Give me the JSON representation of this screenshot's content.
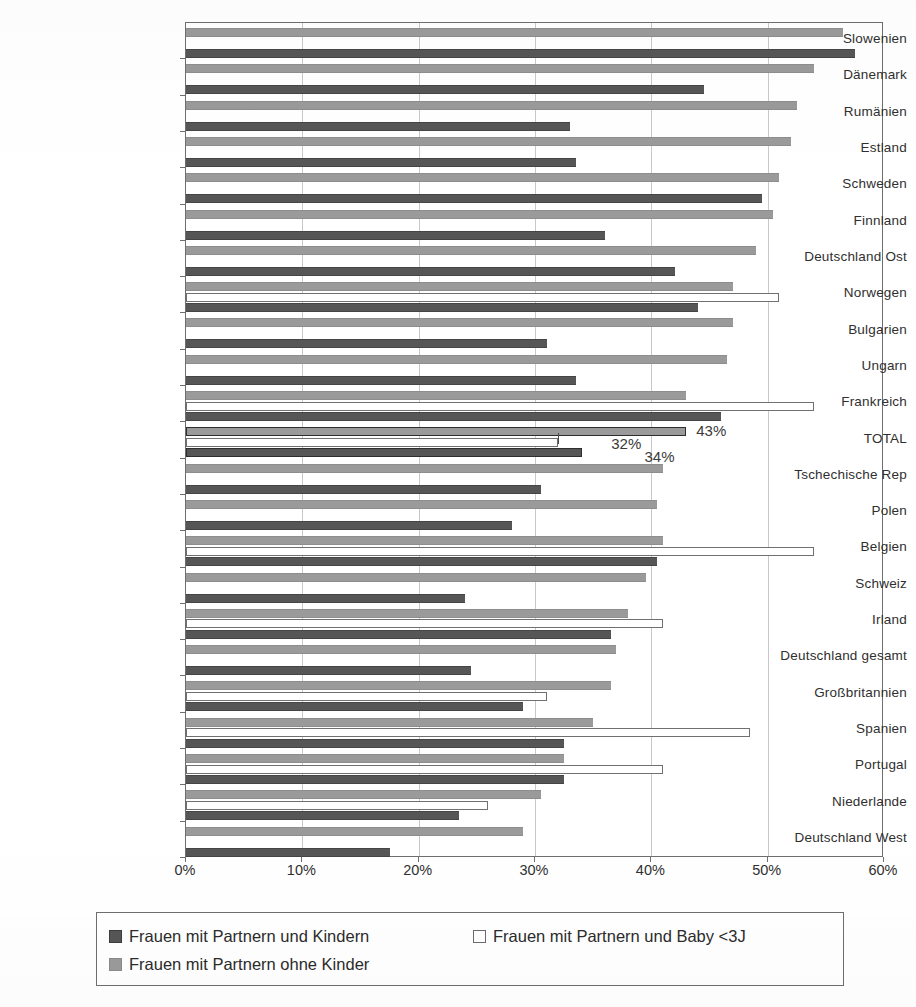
{
  "chart_data": {
    "type": "bar",
    "orientation": "horizontal",
    "title": "",
    "xlabel": "",
    "ylabel": "",
    "xlim": [
      0,
      60
    ],
    "xunit": "%",
    "grid": true,
    "legend_position": "bottom",
    "x_ticks": [
      "0%",
      "10%",
      "20%",
      "30%",
      "40%",
      "50%",
      "60%"
    ],
    "x_tick_values": [
      0,
      10,
      20,
      30,
      40,
      50,
      60
    ],
    "categories": [
      "Slowenien",
      "Dänemark",
      "Rumänien",
      "Estland",
      "Schweden",
      "Finnland",
      "Deutschland Ost",
      "Norwegen",
      "Bulgarien",
      "Ungarn",
      "Frankreich",
      "TOTAL",
      "Tschechische Rep",
      "Polen",
      "Belgien",
      "Schweiz",
      "Irland",
      "Deutschland gesamt",
      "Großbritannien",
      "Spanien",
      "Portugal",
      "Niederlande",
      "Deutschland West"
    ],
    "series": [
      {
        "name": "Frauen mit Partnern ohne Kinder",
        "key": "ohne_kinder",
        "color": "#9a9a9a",
        "values": [
          56.5,
          54.0,
          52.5,
          52.0,
          51.0,
          50.5,
          49.0,
          47.0,
          47.0,
          46.5,
          43.0,
          43.0,
          41.0,
          40.5,
          41.0,
          39.5,
          38.0,
          37.0,
          36.5,
          35.0,
          32.5,
          30.5,
          29.0
        ]
      },
      {
        "name": "Frauen mit Partnern und Baby <3J",
        "key": "baby_unter_3j",
        "color": "#ffffff",
        "values": [
          null,
          null,
          null,
          null,
          null,
          null,
          null,
          51.0,
          null,
          null,
          54.0,
          32.0,
          null,
          null,
          54.0,
          null,
          41.0,
          null,
          31.0,
          48.5,
          41.0,
          26.0,
          null
        ]
      },
      {
        "name": "Frauen mit Partnern und Kindern",
        "key": "mit_kindern",
        "color": "#565656",
        "values": [
          57.5,
          44.5,
          33.0,
          33.5,
          49.5,
          36.0,
          42.0,
          44.0,
          31.0,
          33.5,
          46.0,
          34.0,
          30.5,
          28.0,
          40.5,
          24.0,
          36.5,
          24.5,
          29.0,
          32.5,
          32.5,
          23.5,
          17.5
        ]
      }
    ],
    "annotations": [
      {
        "label": "43%",
        "category": "TOTAL",
        "series": "ohne_kinder",
        "value": 43
      },
      {
        "label": "32%",
        "category": "TOTAL",
        "series": "baby_unter_3j",
        "value": 32
      },
      {
        "label": "34%",
        "category": "TOTAL",
        "series": "mit_kindern",
        "value": 34
      }
    ]
  },
  "legend": {
    "items": [
      {
        "label": "Frauen mit Partnern und Kindern",
        "swatch": "s-dark"
      },
      {
        "label": "Frauen mit Partnern und Baby <3J",
        "swatch": "s-white"
      },
      {
        "label": "Frauen mit Partnern ohne Kinder",
        "swatch": "s-gray"
      }
    ]
  },
  "colors": {
    "series_dark": "#565656",
    "series_gray": "#9a9a9a",
    "series_white": "#ffffff",
    "axis": "#6e6e6e",
    "grid": "#c9c9c9",
    "text": "#2b2b2b"
  }
}
